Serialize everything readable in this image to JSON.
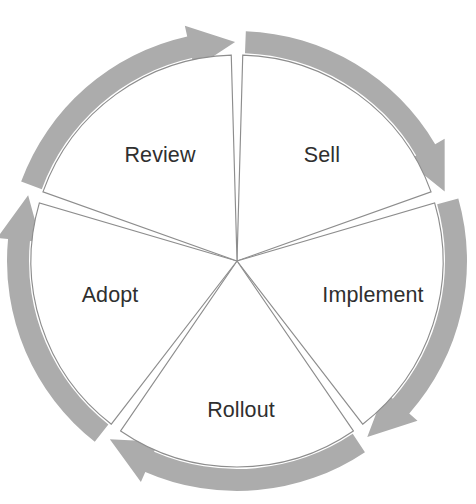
{
  "diagram": {
    "type": "cycle-wheel",
    "segment_count": 5,
    "direction": "clockwise",
    "geometry": {
      "center_x": 237,
      "center_y": 261,
      "outer_radius": 230,
      "band_thickness": 22,
      "wedge_radius": 206,
      "wedge_gap_degrees": 1.6,
      "segment_span_degrees": 72,
      "start_angle_degrees": -90
    },
    "colors": {
      "arrow_gray": "#acacac",
      "wedge_fill": "#ffffff",
      "wedge_outline": "#8d8d8d",
      "label_text": "#2f2f2f",
      "background": "#ffffff"
    },
    "segments": [
      {
        "id": "sell",
        "label": "Sell",
        "order": 1,
        "start_angle": -90,
        "end_angle": -18,
        "label_x": 322,
        "label_y": 155,
        "arrowhead_position": "upper-right",
        "arrowhead_direction": "down-right"
      },
      {
        "id": "implement",
        "label": "Implement",
        "order": 2,
        "start_angle": -18,
        "end_angle": 54,
        "label_x": 373,
        "label_y": 295,
        "arrowhead_position": "lower-right",
        "arrowhead_direction": "down-left"
      },
      {
        "id": "rollout",
        "label": "Rollout",
        "order": 3,
        "start_angle": 54,
        "end_angle": 126,
        "label_x": 241,
        "label_y": 410,
        "arrowhead_position": "bottom-left",
        "arrowhead_direction": "left"
      },
      {
        "id": "adopt",
        "label": "Adopt",
        "order": 4,
        "start_angle": 126,
        "end_angle": 198,
        "label_x": 110,
        "label_y": 295,
        "arrowhead_position": "left",
        "arrowhead_direction": "up"
      },
      {
        "id": "review",
        "label": "Review",
        "order": 5,
        "start_angle": 198,
        "end_angle": 270,
        "label_x": 160,
        "label_y": 155,
        "arrowhead_position": "top",
        "arrowhead_direction": "right"
      }
    ]
  }
}
